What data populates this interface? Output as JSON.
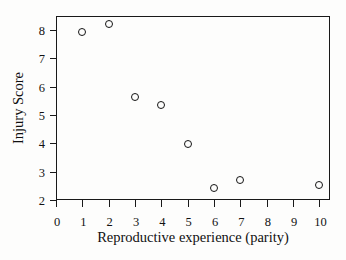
{
  "chart_data": {
    "type": "scatter",
    "title": "",
    "xlabel": "Reproductive experience (parity)",
    "ylabel": "Injury Score",
    "xlim": [
      0,
      10.4
    ],
    "ylim": [
      2,
      8.5
    ],
    "xticks": [
      0,
      1,
      2,
      3,
      4,
      5,
      6,
      7,
      8,
      9,
      10
    ],
    "xtick_labels": [
      "0",
      "1",
      "2",
      "3",
      "4",
      "5",
      "6",
      "7",
      "8",
      "9",
      "10"
    ],
    "yticks": [
      2,
      3,
      4,
      5,
      6,
      7,
      8
    ],
    "ytick_labels": [
      "2",
      "3",
      "4",
      "5",
      "6",
      "7",
      "8"
    ],
    "grid": false,
    "legend": false,
    "marker": "open-circle",
    "marker_color": "#141414",
    "points": [
      {
        "x": 1,
        "y": 7.93
      },
      {
        "x": 2,
        "y": 8.2
      },
      {
        "x": 3,
        "y": 5.63
      },
      {
        "x": 4,
        "y": 5.35
      },
      {
        "x": 5,
        "y": 3.98
      },
      {
        "x": 6,
        "y": 2.43
      },
      {
        "x": 7,
        "y": 2.7
      },
      {
        "x": 10,
        "y": 2.52
      }
    ],
    "x": [
      1,
      2,
      3,
      4,
      5,
      6,
      7,
      10
    ],
    "values": [
      7.93,
      8.2,
      5.63,
      5.35,
      3.98,
      2.43,
      2.7,
      2.52
    ],
    "series": [
      {
        "name": "Injury Score",
        "x": [
          1,
          2,
          3,
          4,
          5,
          6,
          7,
          10
        ],
        "values": [
          7.93,
          8.2,
          5.63,
          5.35,
          3.98,
          2.43,
          2.7,
          2.52
        ]
      }
    ],
    "annotations": []
  }
}
